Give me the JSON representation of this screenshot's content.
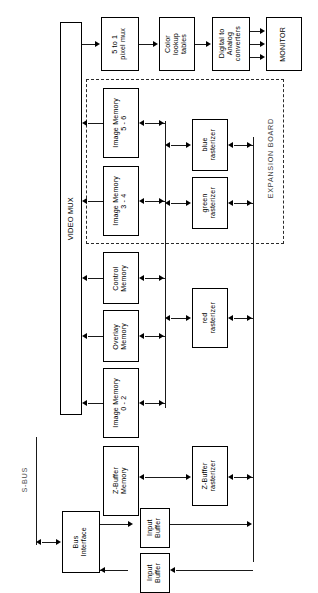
{
  "diagram": {
    "orientation": "rotated-90",
    "regions": [
      {
        "name": "expansion-board",
        "label": "EXPANSION BOARD",
        "style": "dashed"
      }
    ],
    "buses": [
      {
        "name": "s-bus",
        "label": "S-BUS"
      }
    ],
    "blocks": [
      {
        "id": "video-mux",
        "label": "VIDEO MUX"
      },
      {
        "id": "pixel-mux",
        "label": "5 to 1\npixel mux"
      },
      {
        "id": "color-lut",
        "label": "Color\nlookup\ntables"
      },
      {
        "id": "dac",
        "label": "Digital to\nAnalog\nconverters"
      },
      {
        "id": "monitor",
        "label": "MONITOR"
      },
      {
        "id": "image-memory-56",
        "label": "Image Memory\n5 - 6"
      },
      {
        "id": "image-memory-34",
        "label": "Image Memory\n3 - 4"
      },
      {
        "id": "control-memory",
        "label": "Control\nMemory"
      },
      {
        "id": "overlay-memory",
        "label": "Overlay\nMemory"
      },
      {
        "id": "image-memory-02",
        "label": "Image Memory\n0 - 2"
      },
      {
        "id": "zbuffer-memory",
        "label": "Z-Buffer\nMemory"
      },
      {
        "id": "blue-rasterizer",
        "label": "blue\nrasterizer"
      },
      {
        "id": "green-rasterizer",
        "label": "green\nrasterizer"
      },
      {
        "id": "red-rasterizer",
        "label": "red\nrasterizer"
      },
      {
        "id": "zbuffer-rasterizer",
        "label": "Z-Buffer\nrasterizer"
      },
      {
        "id": "bus-interface",
        "label": "Bus\nInterface"
      },
      {
        "id": "input-buffer-1",
        "label": "Input\nBuffer"
      },
      {
        "id": "input-buffer-2",
        "label": "Input\nBuffer"
      }
    ],
    "colors": {
      "line": "#1a1a1a",
      "box_border": "#000000",
      "background": "#ffffff",
      "region_border": "#2b2b2b",
      "region_text": "#3a3a3a"
    }
  }
}
